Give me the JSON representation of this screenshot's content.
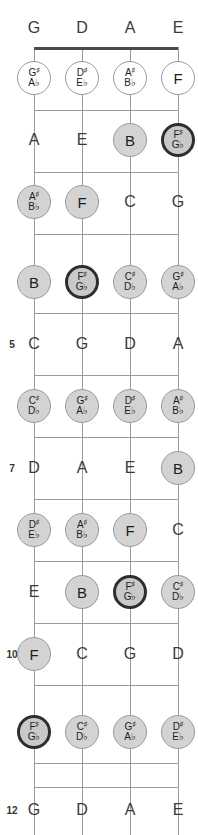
{
  "diagram": {
    "instrument": "4-string bass",
    "orientation": "vertical",
    "colors": {
      "nut": "#4a4a4a",
      "fret_line": "#9a9a9a",
      "string": "#9a9a9a",
      "note_fill_gray": "#d3d3d3",
      "note_fill_white": "#ffffff",
      "root_border": "#2e2e2e",
      "text": "#1d1d1d",
      "background": "#ffffff"
    }
  },
  "strings": [
    {
      "label": "G",
      "x": 34
    },
    {
      "label": "D",
      "x": 82
    },
    {
      "label": "A",
      "x": 130
    },
    {
      "label": "E",
      "x": 178
    }
  ],
  "fret_numbers": [
    {
      "number": "5",
      "y": 344
    },
    {
      "number": "7",
      "y": 468
    },
    {
      "number": "10",
      "y": 654
    },
    {
      "number": "12",
      "y": 810
    }
  ],
  "frets": [
    {
      "fret": 1,
      "y": 78,
      "notes": [
        {
          "string": "G",
          "natural": "G",
          "accidental": true,
          "sharp": "G#",
          "flat": "A♭",
          "style": "fill-white"
        },
        {
          "string": "D",
          "natural": "D",
          "accidental": true,
          "sharp": "D#",
          "flat": "E♭",
          "style": "fill-white"
        },
        {
          "string": "A",
          "natural": "A",
          "accidental": true,
          "sharp": "A#",
          "flat": "B♭",
          "style": "fill-white"
        },
        {
          "string": "E",
          "natural": "F",
          "accidental": false,
          "label": "F",
          "style": "fill-white"
        }
      ]
    },
    {
      "fret": 2,
      "y": 140,
      "notes": [
        {
          "string": "G",
          "natural": "A",
          "accidental": false,
          "label": "A",
          "style": "plain"
        },
        {
          "string": "D",
          "natural": "E",
          "accidental": false,
          "label": "E",
          "style": "plain"
        },
        {
          "string": "A",
          "natural": "B",
          "accidental": false,
          "label": "B",
          "style": "fill-gray"
        },
        {
          "string": "E",
          "natural": "F",
          "accidental": true,
          "sharp": "F#",
          "flat": "G♭",
          "style": "root"
        }
      ]
    },
    {
      "fret": 3,
      "y": 202,
      "notes": [
        {
          "string": "G",
          "natural": "A",
          "accidental": true,
          "sharp": "A#",
          "flat": "B♭",
          "style": "fill-gray"
        },
        {
          "string": "D",
          "natural": "F",
          "accidental": false,
          "label": "F",
          "style": "fill-gray"
        },
        {
          "string": "A",
          "natural": "C",
          "accidental": false,
          "label": "C",
          "style": "plain"
        },
        {
          "string": "E",
          "natural": "G",
          "accidental": false,
          "label": "G",
          "style": "plain"
        }
      ]
    },
    {
      "fret": 4,
      "y": 282,
      "notes": [
        {
          "string": "G",
          "natural": "B",
          "accidental": false,
          "label": "B",
          "style": "fill-gray"
        },
        {
          "string": "D",
          "natural": "F",
          "accidental": true,
          "sharp": "F#",
          "flat": "G♭",
          "style": "root"
        },
        {
          "string": "A",
          "natural": "C",
          "accidental": true,
          "sharp": "C#",
          "flat": "D♭",
          "style": "fill-gray"
        },
        {
          "string": "E",
          "natural": "G",
          "accidental": true,
          "sharp": "G#",
          "flat": "A♭",
          "style": "fill-gray"
        }
      ]
    },
    {
      "fret": 5,
      "y": 344,
      "notes": [
        {
          "string": "G",
          "natural": "C",
          "accidental": false,
          "label": "C",
          "style": "plain"
        },
        {
          "string": "D",
          "natural": "G",
          "accidental": false,
          "label": "G",
          "style": "plain"
        },
        {
          "string": "A",
          "natural": "D",
          "accidental": false,
          "label": "D",
          "style": "plain"
        },
        {
          "string": "E",
          "natural": "A",
          "accidental": false,
          "label": "A",
          "style": "plain"
        }
      ]
    },
    {
      "fret": 6,
      "y": 406,
      "notes": [
        {
          "string": "G",
          "natural": "C",
          "accidental": true,
          "sharp": "C#",
          "flat": "D♭",
          "style": "fill-gray"
        },
        {
          "string": "D",
          "natural": "G",
          "accidental": true,
          "sharp": "G#",
          "flat": "A♭",
          "style": "fill-gray"
        },
        {
          "string": "A",
          "natural": "D",
          "accidental": true,
          "sharp": "D#",
          "flat": "E♭",
          "style": "fill-gray"
        },
        {
          "string": "E",
          "natural": "A",
          "accidental": true,
          "sharp": "A#",
          "flat": "B♭",
          "style": "fill-gray"
        }
      ]
    },
    {
      "fret": 7,
      "y": 468,
      "notes": [
        {
          "string": "G",
          "natural": "D",
          "accidental": false,
          "label": "D",
          "style": "plain"
        },
        {
          "string": "D",
          "natural": "A",
          "accidental": false,
          "label": "A",
          "style": "plain"
        },
        {
          "string": "A",
          "natural": "E",
          "accidental": false,
          "label": "E",
          "style": "plain"
        },
        {
          "string": "E",
          "natural": "B",
          "accidental": false,
          "label": "B",
          "style": "fill-gray"
        }
      ]
    },
    {
      "fret": 8,
      "y": 530,
      "notes": [
        {
          "string": "G",
          "natural": "D",
          "accidental": true,
          "sharp": "D#",
          "flat": "E♭",
          "style": "fill-gray"
        },
        {
          "string": "D",
          "natural": "A",
          "accidental": true,
          "sharp": "A#",
          "flat": "B♭",
          "style": "fill-gray"
        },
        {
          "string": "A",
          "natural": "F",
          "accidental": false,
          "label": "F",
          "style": "fill-gray"
        },
        {
          "string": "E",
          "natural": "C",
          "accidental": false,
          "label": "C",
          "style": "plain"
        }
      ]
    },
    {
      "fret": 9,
      "y": 592,
      "notes": [
        {
          "string": "G",
          "natural": "E",
          "accidental": false,
          "label": "E",
          "style": "plain"
        },
        {
          "string": "D",
          "natural": "B",
          "accidental": false,
          "label": "B",
          "style": "fill-gray"
        },
        {
          "string": "A",
          "natural": "F",
          "accidental": true,
          "sharp": "F#",
          "flat": "G♭",
          "style": "root"
        },
        {
          "string": "E",
          "natural": "C",
          "accidental": true,
          "sharp": "C#",
          "flat": "D♭",
          "style": "fill-gray"
        }
      ]
    },
    {
      "fret": 10,
      "y": 654,
      "notes": [
        {
          "string": "G",
          "natural": "F",
          "accidental": false,
          "label": "F",
          "style": "fill-gray"
        },
        {
          "string": "D",
          "natural": "C",
          "accidental": false,
          "label": "C",
          "style": "plain"
        },
        {
          "string": "A",
          "natural": "G",
          "accidental": false,
          "label": "G",
          "style": "plain"
        },
        {
          "string": "E",
          "natural": "D",
          "accidental": false,
          "label": "D",
          "style": "plain"
        }
      ]
    },
    {
      "fret": 11,
      "y": 732,
      "notes": [
        {
          "string": "G",
          "natural": "F",
          "accidental": true,
          "sharp": "F#",
          "flat": "G♭",
          "style": "root"
        },
        {
          "string": "D",
          "natural": "C",
          "accidental": true,
          "sharp": "C#",
          "flat": "D♭",
          "style": "fill-gray"
        },
        {
          "string": "A",
          "natural": "G",
          "accidental": true,
          "sharp": "G#",
          "flat": "A♭",
          "style": "fill-gray"
        },
        {
          "string": "E",
          "natural": "D",
          "accidental": true,
          "sharp": "D#",
          "flat": "E♭",
          "style": "fill-gray"
        }
      ]
    },
    {
      "fret": 12,
      "y": 810,
      "notes": [
        {
          "string": "G",
          "natural": "G",
          "accidental": false,
          "label": "G",
          "style": "plain"
        },
        {
          "string": "D",
          "natural": "D",
          "accidental": false,
          "label": "D",
          "style": "plain"
        },
        {
          "string": "A",
          "natural": "A",
          "accidental": false,
          "label": "A",
          "style": "plain"
        },
        {
          "string": "E",
          "natural": "E",
          "accidental": false,
          "label": "E",
          "style": "plain"
        }
      ]
    }
  ],
  "geometry": {
    "string_top_label_y": 28,
    "nut_y": 47,
    "fret_line_ys": [
      47,
      110,
      172,
      234,
      313,
      375,
      437,
      499,
      561,
      623,
      685,
      763,
      787
    ],
    "string_left": 34,
    "string_right": 178,
    "board_bottom": 835,
    "fret_number_x": 12
  }
}
